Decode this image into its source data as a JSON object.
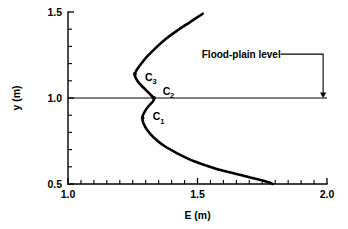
{
  "chart_data": {
    "type": "line",
    "title": "",
    "xlabel": "E (m)",
    "ylabel": "y (m)",
    "xlim": [
      1.0,
      2.0
    ],
    "ylim": [
      0.5,
      1.5
    ],
    "grid": false,
    "legend": null,
    "x_ticks": [
      1.0,
      1.5,
      2.0
    ],
    "x_tick_labels": [
      "1.0",
      "1.5",
      "2.0"
    ],
    "x_minor_step": 0.05,
    "y_ticks": [
      0.5,
      1.0,
      1.5
    ],
    "y_tick_labels": [
      "0.5",
      "1.0",
      "1.5"
    ],
    "y_minor_step": 0.1,
    "series": [
      {
        "name": "specific-energy-curve",
        "comment": "Compound-channel specific energy curve E vs depth y, S-shaped with two noses",
        "points": [
          [
            1.52,
            1.49
          ],
          [
            1.47,
            1.44
          ],
          [
            1.42,
            1.39
          ],
          [
            1.375,
            1.34
          ],
          [
            1.338,
            1.29
          ],
          [
            1.305,
            1.24
          ],
          [
            1.278,
            1.19
          ],
          [
            1.262,
            1.155
          ],
          [
            1.258,
            1.135
          ],
          [
            1.262,
            1.115
          ],
          [
            1.275,
            1.085
          ],
          [
            1.295,
            1.055
          ],
          [
            1.315,
            1.025
          ],
          [
            1.328,
            1.005
          ],
          [
            1.332,
            0.995
          ],
          [
            1.327,
            0.978
          ],
          [
            1.312,
            0.955
          ],
          [
            1.298,
            0.925
          ],
          [
            1.289,
            0.898
          ],
          [
            1.287,
            0.878
          ],
          [
            1.292,
            0.85
          ],
          [
            1.305,
            0.815
          ],
          [
            1.33,
            0.772
          ],
          [
            1.368,
            0.725
          ],
          [
            1.42,
            0.68
          ],
          [
            1.487,
            0.632
          ],
          [
            1.565,
            0.592
          ],
          [
            1.65,
            0.558
          ],
          [
            1.72,
            0.532
          ],
          [
            1.775,
            0.51
          ],
          [
            1.79,
            0.5
          ]
        ]
      }
    ],
    "flood_plain_level": {
      "label": "Flood-plain level",
      "y_value": 1.0,
      "x_from": 1.0,
      "x_to": 2.0,
      "arrow_x": 1.985,
      "label_x": 1.52,
      "label_y": 1.255
    },
    "annotations": [
      {
        "label": "C",
        "subscript": "3",
        "x": 1.258,
        "y": 1.14,
        "label_dx": 0.028,
        "label_dy": -0.018
      },
      {
        "label": "C",
        "subscript": "2",
        "x": 1.332,
        "y": 1.0,
        "label_dx": 0.022,
        "label_dy": 0.042
      },
      {
        "label": "C",
        "subscript": "1",
        "x": 1.288,
        "y": 0.883,
        "label_dx": 0.028,
        "label_dy": 0.01
      }
    ]
  },
  "axes": {
    "y_axis_label": "y (m)",
    "x_axis_label": "E (m)"
  }
}
